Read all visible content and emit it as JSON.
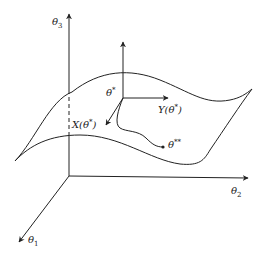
{
  "figure": {
    "type": "manifold-with-tangent-vectors",
    "axes": [
      {
        "id": "theta1",
        "label": "θ",
        "sub": "1"
      },
      {
        "id": "theta2",
        "label": "θ",
        "sub": "2"
      },
      {
        "id": "theta3",
        "label": "θ",
        "sub": "3"
      }
    ],
    "points": [
      {
        "id": "theta-star",
        "label": "θ",
        "sup": "*"
      },
      {
        "id": "theta-double-star",
        "label": "θ",
        "sup": "**"
      }
    ],
    "vectors": [
      {
        "id": "Y",
        "label": "Y(θ",
        "sup": "*",
        "close": ")"
      },
      {
        "id": "X",
        "label": "X(θ",
        "sup": "*",
        "close": ")"
      }
    ],
    "colors": {
      "stroke": "#222222",
      "background": "#ffffff"
    }
  }
}
